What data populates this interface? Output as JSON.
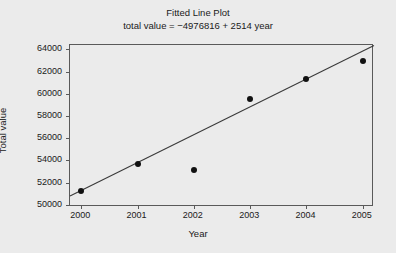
{
  "chart_data": {
    "type": "scatter",
    "title": "Fitted Line Plot",
    "subtitle": "total value = −4976816 + 2514 year",
    "xlabel": "Year",
    "ylabel": "Total value",
    "x": [
      2000,
      2001,
      2002,
      2003,
      2004,
      2005
    ],
    "values": [
      51200,
      53700,
      53100,
      59500,
      61300,
      63000
    ],
    "series": [
      {
        "name": "Total value",
        "values": [
          51200,
          53700,
          53100,
          59500,
          61300,
          63000
        ]
      }
    ],
    "fit_line": {
      "intercept": -4976816,
      "slope": 2514,
      "x_start": 1999.8,
      "x_end": 2005.2,
      "y_start": 50787,
      "y_end": 64364
    },
    "xlim": [
      1999.8,
      2005.2
    ],
    "ylim": [
      49800,
      64400
    ],
    "xticks": [
      2000,
      2001,
      2002,
      2003,
      2004,
      2005
    ],
    "xtick_labels": [
      "2000",
      "2001",
      "2002",
      "2003",
      "2004",
      "2005"
    ],
    "yticks": [
      50000,
      52000,
      54000,
      56000,
      58000,
      60000,
      62000,
      64000
    ],
    "ytick_labels": [
      "50000",
      "52000",
      "54000",
      "56000",
      "58000",
      "60000",
      "62000",
      "64000"
    ],
    "grid": false,
    "legend": false,
    "colors": {
      "background": "#ebebeb",
      "axis": "#5a5a5a",
      "marker": "#111111",
      "line": "#3a3a3a",
      "text": "#1a1a1a"
    }
  }
}
